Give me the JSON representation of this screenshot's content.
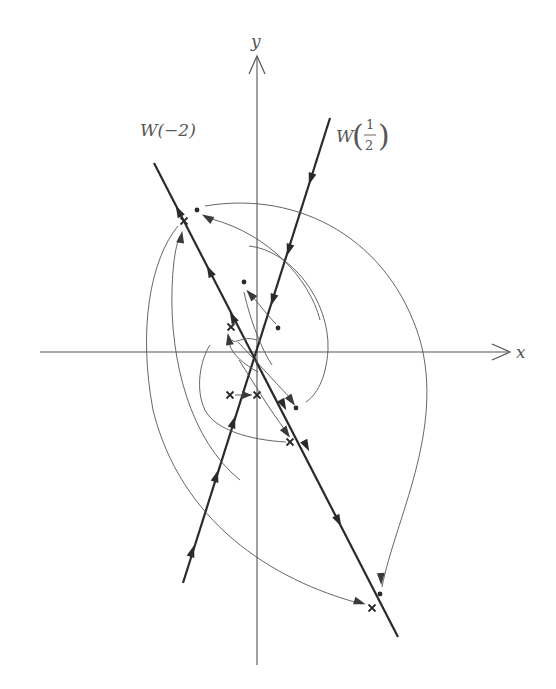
{
  "figure": {
    "axes": {
      "x_label": "x",
      "y_label": "y"
    },
    "lines": [
      {
        "name": "W(-2)",
        "label_main": "W(−2)",
        "direction": "outward from origin (unstable manifold)"
      },
      {
        "name": "W(1/2)",
        "label_prefix": "W",
        "label_num": "1",
        "label_den": "2",
        "direction": "inward to origin (stable manifold)"
      }
    ],
    "markers": {
      "cross_symbol": "×",
      "dot_symbol": "•"
    },
    "colors": {
      "line": "#2a2a2a",
      "axis": "#555555",
      "curve": "#555555",
      "background": "#ffffff"
    }
  }
}
